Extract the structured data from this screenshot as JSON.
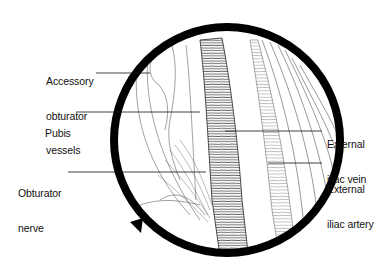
{
  "figure": {
    "type": "anatomical-illustration",
    "view": "circular magnified field",
    "colors": {
      "ink": "#111111",
      "background": "#ffffff",
      "ring": "#000000"
    }
  },
  "labels": [
    {
      "id": "accessory-obturator-vessels",
      "lines": [
        "Accessory",
        "obturator",
        "vessels"
      ],
      "side": "left"
    },
    {
      "id": "pubis",
      "lines": [
        "Pubis"
      ],
      "side": "left"
    },
    {
      "id": "obturator-nerve",
      "lines": [
        "Obturator",
        "nerve"
      ],
      "side": "left"
    },
    {
      "id": "external-iliac-vein",
      "lines": [
        "External",
        "iliac vein"
      ],
      "side": "right"
    },
    {
      "id": "external-iliac-artery",
      "lines": [
        "External",
        "iliac artery"
      ],
      "side": "right"
    }
  ]
}
